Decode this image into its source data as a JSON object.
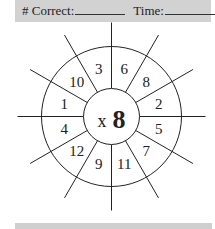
{
  "header": {
    "correct_label": "# Correct:",
    "time_label": "Time:"
  },
  "wheel": {
    "operator": "x",
    "multiplier": "8",
    "sectors": [
      {
        "label": "6"
      },
      {
        "label": "8"
      },
      {
        "label": "2"
      },
      {
        "label": "5"
      },
      {
        "label": "7"
      },
      {
        "label": "11"
      },
      {
        "label": "9"
      },
      {
        "label": "12"
      },
      {
        "label": "4"
      },
      {
        "label": "1"
      },
      {
        "label": "10"
      },
      {
        "label": "3"
      }
    ]
  },
  "colors": {
    "bar": "#d2d2d2",
    "ink": "#222222"
  }
}
